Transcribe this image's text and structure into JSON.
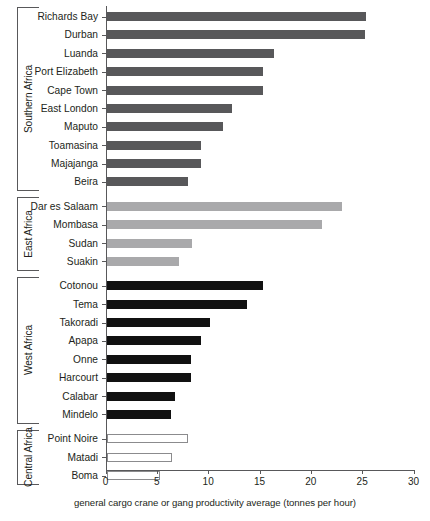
{
  "chart_data": {
    "type": "bar",
    "orientation": "horizontal",
    "title": "",
    "xlabel": "general cargo crane or gang productivity average (tonnes per hour)",
    "ylabel": "",
    "xlim": [
      0,
      30
    ],
    "xticks": [
      0,
      5,
      10,
      15,
      20,
      25,
      30
    ],
    "grid": false,
    "legend": "none",
    "groups": [
      {
        "name": "Southern Africa",
        "color": "#58585a",
        "categories": [
          "Richards Bay",
          "Durban",
          "Luanda",
          "Port Elizabeth",
          "Cape Town",
          "East London",
          "Maputo",
          "Toamasina",
          "Majajanga",
          "Beira"
        ],
        "values": [
          25.3,
          25.2,
          16.3,
          15.2,
          15.2,
          12.2,
          11.3,
          9.2,
          9.2,
          7.9
        ]
      },
      {
        "name": "East Africa",
        "color": "#a9a9ab",
        "categories": [
          "Dar es Salaam",
          "Mombasa",
          "Sudan",
          "Suakin"
        ],
        "values": [
          22.9,
          21.0,
          8.3,
          7.1
        ]
      },
      {
        "name": "West Africa",
        "color": "#111111",
        "categories": [
          "Cotonou",
          "Tema",
          "Takoradi",
          "Apapa",
          "Onne",
          "Harcourt",
          "Calabar",
          "Mindelo"
        ],
        "values": [
          15.2,
          13.7,
          10.1,
          9.2,
          8.2,
          8.2,
          6.7,
          6.3
        ]
      },
      {
        "name": "Central Africa",
        "color": "#ffffff",
        "categories": [
          "Point Noire",
          "Matadi",
          "Boma"
        ],
        "values": [
          7.9,
          6.4,
          5.2
        ]
      }
    ],
    "categories": [
      "Richards Bay",
      "Durban",
      "Luanda",
      "Port Elizabeth",
      "Cape Town",
      "East London",
      "Maputo",
      "Toamasina",
      "Majajanga",
      "Beira",
      "Dar es Salaam",
      "Mombasa",
      "Sudan",
      "Suakin",
      "Cotonou",
      "Tema",
      "Takoradi",
      "Apapa",
      "Onne",
      "Harcourt",
      "Calabar",
      "Mindelo",
      "Point Noire",
      "Matadi",
      "Boma"
    ],
    "values": [
      25.3,
      25.2,
      16.3,
      15.2,
      15.2,
      12.2,
      11.3,
      9.2,
      9.2,
      7.9,
      22.9,
      21.0,
      8.3,
      7.1,
      15.2,
      13.7,
      10.1,
      9.2,
      8.2,
      8.2,
      6.7,
      6.3,
      7.9,
      6.4,
      5.2
    ]
  }
}
